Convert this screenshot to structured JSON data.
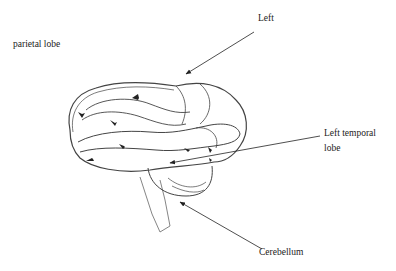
{
  "diagram": {
    "labels": {
      "parietal": "parietal lobe",
      "left": "Left",
      "temporal_line1": "Left temporal",
      "temporal_line2": "lobe",
      "cerebellum": "Cerebellum"
    },
    "colors": {
      "ink": "#333333",
      "background": "#ffffff"
    }
  }
}
